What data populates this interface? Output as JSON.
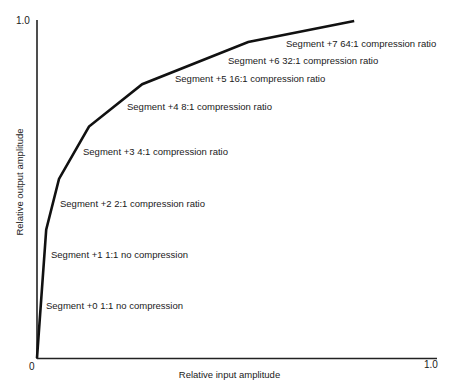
{
  "chart_data": {
    "type": "line",
    "title": "",
    "xlabel": "Relative input amplitude",
    "ylabel": "Relative output amplitude",
    "xlim": [
      0,
      1.0
    ],
    "ylim": [
      0,
      1.0
    ],
    "grid": false,
    "legend": null,
    "x_ticks": [
      "0",
      "1.0"
    ],
    "y_ticks": [
      "1.0"
    ],
    "series": [
      {
        "name": "Compression curve",
        "x": [
          0.0,
          0.023,
          0.055,
          0.13,
          0.263,
          0.528,
          0.793
        ],
        "y": [
          0.0,
          0.38,
          0.53,
          0.685,
          0.81,
          0.935,
          0.997
        ]
      }
    ],
    "annotations": [
      {
        "text": "Segment +0 1:1 no compression",
        "segment": 0,
        "ratio": "1:1"
      },
      {
        "text": "Segment +1 1:1 no compression",
        "segment": 1,
        "ratio": "1:1"
      },
      {
        "text": "Segment +2 2:1 compression ratio",
        "segment": 2,
        "ratio": "2:1"
      },
      {
        "text": "Segment +3 4:1 compression ratio",
        "segment": 3,
        "ratio": "4:1"
      },
      {
        "text": "Segment +4 8:1 compression ratio",
        "segment": 4,
        "ratio": "8:1"
      },
      {
        "text": "Segment +5 16:1 compression ratio",
        "segment": 5,
        "ratio": "16:1"
      },
      {
        "text": "Segment +6 32:1 compression ratio",
        "segment": 6,
        "ratio": "32:1"
      },
      {
        "text": "Segment +7 64:1 compression ratio",
        "segment": 7,
        "ratio": "64:1"
      }
    ]
  },
  "labels": {
    "x_origin": "0",
    "x_max": "1.0",
    "y_max": "1.0"
  },
  "style": {
    "line_color": "#111111",
    "axis_color": "#222222"
  }
}
